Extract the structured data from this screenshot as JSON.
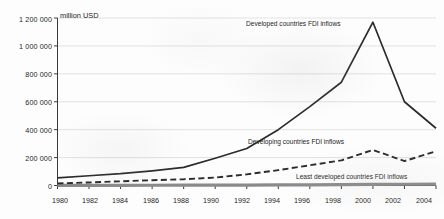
{
  "chart_data": {
    "type": "line",
    "title": "",
    "subtitle": "",
    "xlabel": "",
    "ylabel": "million USD",
    "unit_label": "million USD",
    "grid": true,
    "legend_position": "inline-annotations",
    "x": [
      1980,
      1982,
      1984,
      1986,
      1988,
      1990,
      1992,
      1994,
      1996,
      1998,
      2000,
      2002,
      2004
    ],
    "xlim": [
      1980,
      2004
    ],
    "ylim": [
      0,
      1200000
    ],
    "xticks": [
      "1980",
      "1982",
      "1984",
      "1986",
      "1988",
      "1990",
      "1992",
      "1994",
      "1996",
      "1998",
      "2000",
      "2002",
      "2004"
    ],
    "yticks": [
      "0",
      "200 000",
      "400 000",
      "600 000",
      "800 000",
      "1 000 000",
      "1 200 000"
    ],
    "ytick_values": [
      0,
      200000,
      400000,
      600000,
      800000,
      1000000,
      1200000
    ],
    "series": [
      {
        "name": "Developed countries FDI inflows",
        "style": "solid",
        "color": "#2b2b2b",
        "annotation": "Developed countries FDI inflows",
        "values": [
          55000,
          70000,
          85000,
          105000,
          130000,
          195000,
          265000,
          400000,
          565000,
          740000,
          1170000,
          600000,
          410000
        ],
        "x": [
          1980,
          1982,
          1984,
          1986,
          1988,
          1990,
          1992,
          1994,
          1996,
          1998,
          2000,
          2002,
          2004
        ]
      },
      {
        "name": "Developing countries FDI inflows",
        "style": "dashed",
        "color": "#2b2b2b",
        "annotation": "Developing countries FDI inflows",
        "values": [
          15000,
          22000,
          30000,
          38000,
          45000,
          57000,
          80000,
          110000,
          145000,
          180000,
          255000,
          175000,
          245000
        ],
        "x": [
          1980,
          1982,
          1984,
          1986,
          1988,
          1990,
          1992,
          1994,
          1996,
          1998,
          2000,
          2002,
          2004
        ]
      },
      {
        "name": "Least developed countries FDI inflows",
        "style": "solid-thick-gray",
        "color": "#8a8a8a",
        "annotation": "Least developed countries FDI inflows",
        "values": [
          1000,
          1200,
          1500,
          1700,
          2000,
          2500,
          3000,
          4000,
          5000,
          6000,
          8000,
          9000,
          10000
        ],
        "x": [
          1980,
          1982,
          1984,
          1986,
          1988,
          1990,
          1992,
          1994,
          1996,
          1998,
          2000,
          2002,
          2004
        ]
      }
    ],
    "annotations": [
      {
        "text": "Developed countries FDI inflows",
        "x": 246,
        "y": 23
      },
      {
        "text": "Developing countries FDI inflows",
        "x": 248,
        "y": 141
      },
      {
        "text": "Least developed countries FDI inflows",
        "x": 296,
        "y": 176
      }
    ]
  }
}
